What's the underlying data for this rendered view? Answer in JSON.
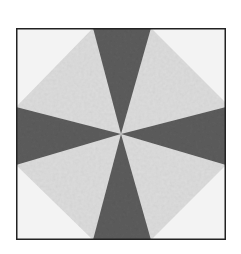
{
  "figure": {
    "pattern": "eight-point pinwheel with four dark wedges on light background, octagon outline",
    "colors": {
      "background": "#ffffff",
      "corner_fabric": "#f2f2f2",
      "light_wedge": "#dcdcdc",
      "dark_wedge": "#5a5a5a",
      "border": "#222222"
    }
  }
}
